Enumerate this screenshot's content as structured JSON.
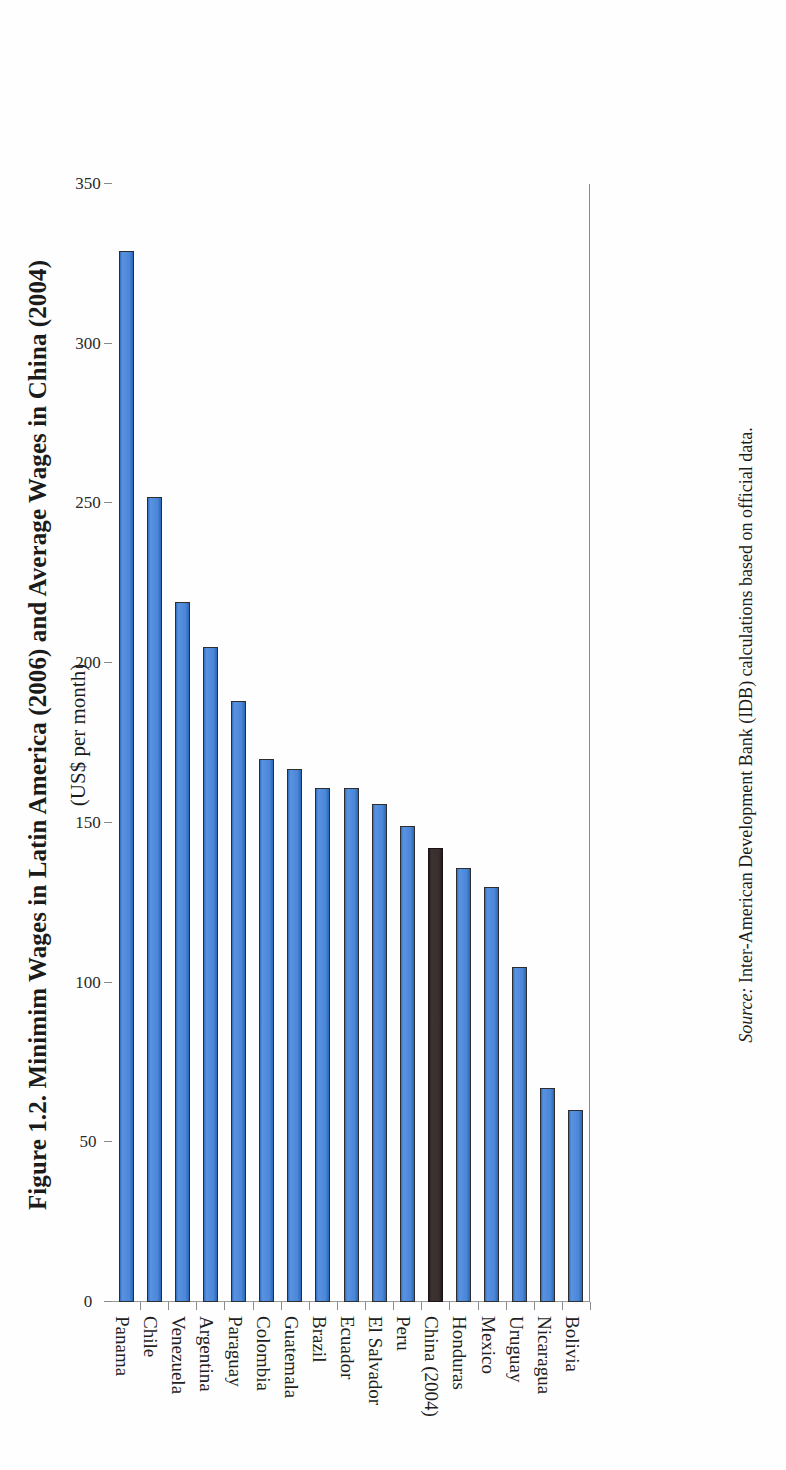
{
  "figure": {
    "title": "Figure 1.2. Minimim Wages in Latin America (2006) and Average Wages in China (2004)",
    "subtitle": "(US$ per month)",
    "source_prefix": "Source:",
    "source_text": " Inter-American Development Bank (IDB) calculations based on official data."
  },
  "colors": {
    "bar_blue": "#4a86d8",
    "bar_blue_dark": "#2f6ec0",
    "bar_highlight": "#342a2a",
    "axis": "#8a8a8a",
    "text": "#1f1f1f",
    "background": "#ffffff"
  },
  "chart_data": {
    "type": "bar",
    "title": "Figure 1.2. Minimim Wages in Latin America (2006) and Average Wages in China (2004)",
    "subtitle": "(US$ per month)",
    "xlabel": "",
    "ylabel": "US$ per month",
    "ylim": [
      0,
      350
    ],
    "yticks": [
      0,
      50,
      100,
      150,
      200,
      250,
      300,
      350
    ],
    "grid": false,
    "legend": false,
    "orientation": "vertical-bars-rotated-page",
    "categories": [
      "Panama",
      "Chile",
      "Venezuela",
      "Argentina",
      "Paraguay",
      "Colombia",
      "Guatemala",
      "Brazil",
      "Ecuador",
      "El Salvador",
      "Peru",
      "China (2004)",
      "Honduras",
      "Mexico",
      "Uruguay",
      "Nicaragua",
      "Bolivia"
    ],
    "values": [
      329,
      252,
      219,
      205,
      188,
      170,
      167,
      161,
      161,
      156,
      149,
      142,
      136,
      130,
      105,
      67,
      60
    ],
    "highlight_index": 11,
    "highlight_label": "China (2004)",
    "series": [
      {
        "name": "Minimum / average wage (US$ per month)",
        "values": [
          329,
          252,
          219,
          205,
          188,
          170,
          167,
          161,
          161,
          156,
          149,
          142,
          136,
          130,
          105,
          67,
          60
        ]
      }
    ]
  }
}
